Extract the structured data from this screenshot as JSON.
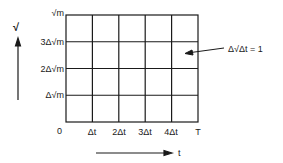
{
  "diagram": {
    "axes": {
      "y_axis_label": "√",
      "x_axis_label": "t",
      "origin_label": "0"
    },
    "y_ticks": [
      "√m",
      "3Δ√m",
      "2Δ√m",
      "Δ√m"
    ],
    "x_ticks": [
      "Δt",
      "2Δt",
      "3Δt",
      "4Δt",
      "T"
    ],
    "annotation": "Δ√Δt = 1",
    "grid": {
      "columns": 5,
      "rows": 4
    }
  }
}
